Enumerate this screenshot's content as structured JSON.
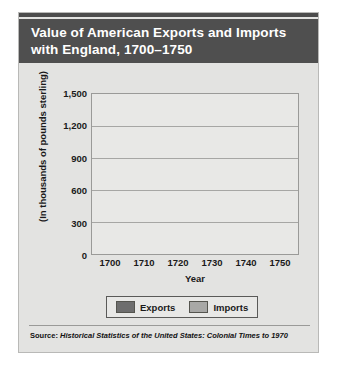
{
  "title": "Value of American Exports and Imports with England, 1700–1750",
  "source": {
    "label": "Source:",
    "text": "Historical Statistics of the United States: Colonial Times to 1970"
  },
  "legend": {
    "exports": "Exports",
    "imports": "Imports"
  },
  "chart_data": {
    "type": "bar",
    "title": "Value of American Exports and Imports with England, 1700–1750",
    "xlabel": "Year",
    "ylabel": "(In thousands of pounds sterling)",
    "categories": [
      "1700",
      "1710",
      "1720",
      "1730",
      "1740",
      "1750"
    ],
    "series": [
      {
        "name": "Exports",
        "color": "#6e6e6e",
        "values": [
          385,
          240,
          470,
          570,
          725,
          810
        ]
      },
      {
        "name": "Imports",
        "color": "#a8a8a6",
        "values": [
          345,
          290,
          315,
          525,
          810,
          1310
        ]
      }
    ],
    "ylim": [
      0,
      1500
    ],
    "yticks": [
      "0",
      "300",
      "600",
      "900",
      "1,200",
      "1,500"
    ],
    "ytick_values": [
      0,
      300,
      600,
      900,
      1200,
      1500
    ],
    "grid": true,
    "legend_position": "bottom"
  },
  "colors": {
    "title_bar": "#4f4f4f",
    "panel": "#e3e3e1",
    "plot_bg": "#e8e8e6",
    "exports": "#6e6e6e",
    "imports": "#a8a8a6"
  }
}
